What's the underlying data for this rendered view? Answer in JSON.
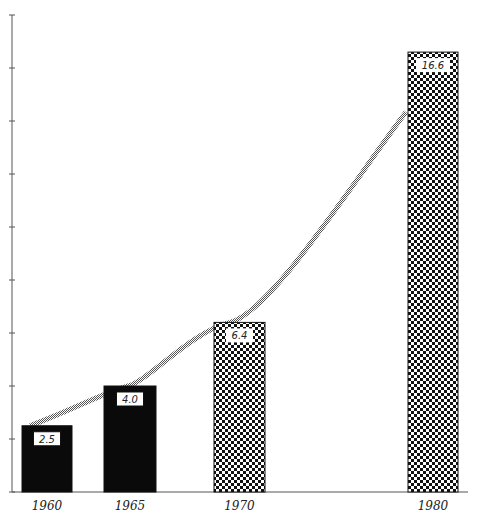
{
  "chart_data": {
    "type": "bar",
    "title": "",
    "xlabel": "",
    "ylabel": "",
    "categories": [
      "1960",
      "1965",
      "1970",
      "1980"
    ],
    "values": [
      2.5,
      4.0,
      6.4,
      16.6
    ],
    "value_labels": [
      "2.5",
      "4.0",
      "6.4",
      "16.6"
    ],
    "bar_styles": [
      "solid",
      "solid",
      "dotted",
      "dotted"
    ],
    "ylim": [
      0,
      18
    ],
    "y_ticks": [
      0,
      2,
      4,
      6,
      8,
      10,
      12,
      14,
      16,
      18
    ],
    "y_tick_labels_shown": false,
    "grid": false,
    "legend": null,
    "trend_curve": {
      "shown": true,
      "style": "hatched gray band",
      "through": "bar tops"
    }
  },
  "colors": {
    "solid_bar": "#0a0a0a",
    "dot": "#111111",
    "curve": "#888888",
    "axis": "#555555"
  }
}
